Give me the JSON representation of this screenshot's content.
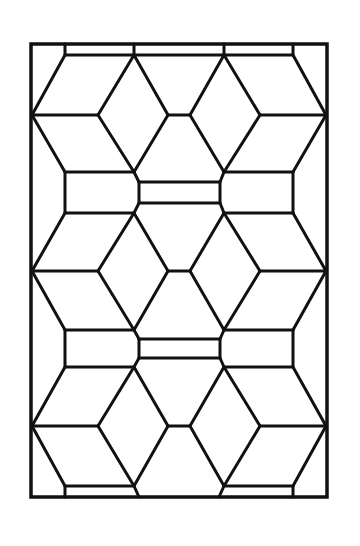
{
  "diagram": {
    "title": "",
    "stroke_color": "#111111",
    "background": "#ffffff",
    "frame": {
      "x": 31,
      "y": 44,
      "w": 296,
      "h": 453
    },
    "segments": [
      [
        65,
        44,
        65,
        55
      ],
      [
        65,
        55,
        134,
        55
      ],
      [
        134,
        55,
        134,
        44
      ],
      [
        224,
        44,
        224,
        55
      ],
      [
        224,
        55,
        293,
        55
      ],
      [
        293,
        55,
        293,
        44
      ],
      [
        134,
        55,
        224,
        55
      ],
      [
        65,
        55,
        32,
        115
      ],
      [
        32,
        115,
        98,
        115
      ],
      [
        98,
        115,
        134,
        55
      ],
      [
        293,
        55,
        326,
        115
      ],
      [
        326,
        115,
        260,
        115
      ],
      [
        260,
        115,
        224,
        55
      ],
      [
        134,
        55,
        168,
        115
      ],
      [
        168,
        115,
        190,
        115
      ],
      [
        190,
        115,
        224,
        55
      ],
      [
        98,
        115,
        134,
        172
      ],
      [
        134,
        172,
        168,
        115
      ],
      [
        260,
        115,
        224,
        172
      ],
      [
        224,
        172,
        190,
        115
      ],
      [
        32,
        115,
        65,
        172
      ],
      [
        326,
        115,
        293,
        172
      ],
      [
        65,
        172,
        134,
        172
      ],
      [
        224,
        172,
        293,
        172
      ],
      [
        65,
        172,
        65,
        213
      ],
      [
        293,
        172,
        293,
        213
      ],
      [
        65,
        213,
        134,
        213
      ],
      [
        224,
        213,
        293,
        213
      ],
      [
        134,
        172,
        139,
        182
      ],
      [
        139,
        182,
        220,
        182
      ],
      [
        220,
        182,
        224,
        172
      ],
      [
        139,
        182,
        139,
        203
      ],
      [
        220,
        182,
        220,
        203
      ],
      [
        134,
        213,
        139,
        203
      ],
      [
        139,
        203,
        220,
        203
      ],
      [
        220,
        203,
        224,
        213
      ],
      [
        65,
        213,
        32,
        271
      ],
      [
        32,
        271,
        98,
        271
      ],
      [
        98,
        271,
        134,
        213
      ],
      [
        293,
        213,
        326,
        271
      ],
      [
        326,
        271,
        260,
        271
      ],
      [
        260,
        271,
        224,
        213
      ],
      [
        134,
        213,
        168,
        271
      ],
      [
        168,
        271,
        190,
        271
      ],
      [
        190,
        271,
        224,
        213
      ],
      [
        98,
        271,
        134,
        330
      ],
      [
        134,
        330,
        168,
        271
      ],
      [
        260,
        271,
        224,
        330
      ],
      [
        224,
        330,
        190,
        271
      ],
      [
        32,
        271,
        65,
        330
      ],
      [
        326,
        271,
        293,
        330
      ],
      [
        65,
        330,
        134,
        330
      ],
      [
        224,
        330,
        293,
        330
      ],
      [
        65,
        330,
        65,
        367
      ],
      [
        293,
        330,
        293,
        367
      ],
      [
        65,
        367,
        134,
        367
      ],
      [
        224,
        367,
        293,
        367
      ],
      [
        134,
        330,
        139,
        339
      ],
      [
        139,
        339,
        220,
        339
      ],
      [
        220,
        339,
        224,
        330
      ],
      [
        139,
        339,
        139,
        358
      ],
      [
        220,
        339,
        220,
        358
      ],
      [
        134,
        367,
        139,
        358
      ],
      [
        139,
        358,
        220,
        358
      ],
      [
        220,
        358,
        224,
        367
      ],
      [
        65,
        367,
        32,
        426
      ],
      [
        32,
        426,
        98,
        426
      ],
      [
        98,
        426,
        134,
        367
      ],
      [
        293,
        367,
        326,
        426
      ],
      [
        326,
        426,
        260,
        426
      ],
      [
        260,
        426,
        224,
        367
      ],
      [
        134,
        367,
        168,
        426
      ],
      [
        168,
        426,
        190,
        426
      ],
      [
        190,
        426,
        224,
        367
      ],
      [
        98,
        426,
        134,
        486
      ],
      [
        134,
        486,
        168,
        426
      ],
      [
        260,
        426,
        224,
        486
      ],
      [
        224,
        486,
        190,
        426
      ],
      [
        32,
        426,
        65,
        486
      ],
      [
        326,
        426,
        293,
        486
      ],
      [
        65,
        486,
        134,
        486
      ],
      [
        224,
        486,
        293,
        486
      ],
      [
        65,
        486,
        65,
        497
      ],
      [
        293,
        486,
        293,
        497
      ],
      [
        134,
        486,
        139,
        497
      ],
      [
        224,
        486,
        219,
        497
      ]
    ]
  }
}
